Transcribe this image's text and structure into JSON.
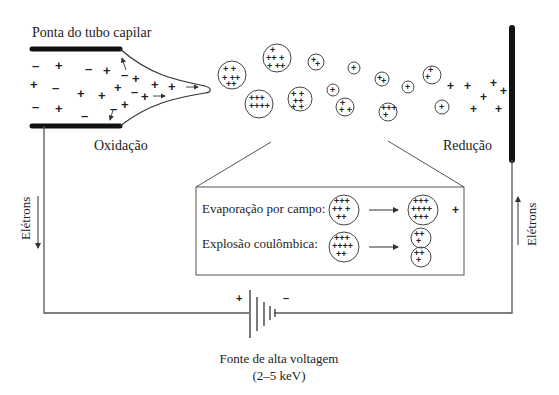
{
  "labels": {
    "capillary_tip": "Ponta do tubo capilar",
    "oxidation": "Oxidação",
    "reduction": "Redução",
    "electrons_left": "Elétrons",
    "electrons_right": "Elétrons",
    "power_source": "Fonte de alta voltagem",
    "power_range": "(2–5 keV)",
    "battery_plus": "+",
    "battery_minus": "–"
  },
  "inset": {
    "field_evaporation": "Evaporação por campo:",
    "coulomb_explosion": "Explosão coulômbica:",
    "released_ion": "+"
  },
  "colors": {
    "ink": "#222222",
    "line": "#555555",
    "electrode": "#111111",
    "background": "#ffffff"
  }
}
